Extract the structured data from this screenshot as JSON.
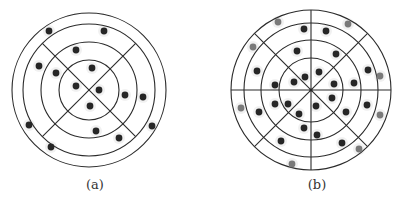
{
  "colors": {
    "line": "#2b2b2b",
    "dot_dark": "#262626",
    "dot_gray": "#7a7a7a",
    "halo": "#e6e6e6",
    "background": "#ffffff"
  },
  "panels": [
    {
      "id": "a",
      "caption": "(a)",
      "caption_pos": [
        75,
        177
      ],
      "center": [
        89,
        90
      ],
      "rings": [
        77,
        66,
        48,
        30
      ],
      "sector_lines": [
        45,
        135
      ],
      "sector_line_radius": 66,
      "dots_dark": [
        [
          49,
          31
        ],
        [
          104,
          31
        ],
        [
          76,
          50
        ],
        [
          39,
          66
        ],
        [
          56,
          73
        ],
        [
          92,
          68
        ],
        [
          76,
          86
        ],
        [
          99,
          90
        ],
        [
          125,
          95
        ],
        [
          143,
          97
        ],
        [
          90,
          106
        ],
        [
          29,
          125
        ],
        [
          152,
          126
        ],
        [
          96,
          131
        ],
        [
          119,
          138
        ],
        [
          51,
          147
        ]
      ],
      "dots_gray": []
    },
    {
      "id": "b",
      "caption": "(b)",
      "caption_pos": [
        297,
        177
      ],
      "center": [
        311,
        90
      ],
      "rings": [
        80,
        67,
        50,
        32
      ],
      "sector_lines": [
        0,
        45,
        90,
        135
      ],
      "sector_line_radius": 80,
      "dots_dark": [
        [
          304,
          29
        ],
        [
          326,
          31
        ],
        [
          297,
          51
        ],
        [
          336,
          54
        ],
        [
          257,
          71
        ],
        [
          368,
          70
        ],
        [
          305,
          77
        ],
        [
          319,
          72
        ],
        [
          294,
          82
        ],
        [
          334,
          84
        ],
        [
          354,
          83
        ],
        [
          275,
          85
        ],
        [
          332,
          98
        ],
        [
          275,
          104
        ],
        [
          288,
          104
        ],
        [
          316,
          106
        ],
        [
          259,
          112
        ],
        [
          299,
          114
        ],
        [
          367,
          105
        ],
        [
          346,
          112
        ],
        [
          304,
          128
        ],
        [
          317,
          135
        ],
        [
          281,
          141
        ],
        [
          342,
          143
        ]
      ],
      "dots_gray": [
        [
          278,
          22
        ],
        [
          348,
          24
        ],
        [
          253,
          47
        ],
        [
          380,
          76
        ],
        [
          241,
          108
        ],
        [
          380,
          115
        ],
        [
          359,
          149
        ],
        [
          292,
          164
        ]
      ]
    }
  ]
}
